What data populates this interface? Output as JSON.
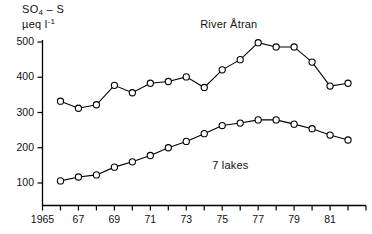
{
  "chart_data": {
    "type": "line",
    "title": "",
    "ylabel": "SO4-S  µeq l-1",
    "ylabel_parts": {
      "line1_pre": "SO",
      "line1_sub": "4",
      "line1_post": " – S",
      "line2_pre": "µeq l",
      "line2_sup": "-1"
    },
    "xlabel": "",
    "xlim": [
      1965,
      1983
    ],
    "ylim": [
      0,
      520
    ],
    "yticks": [
      100,
      200,
      300,
      400,
      500
    ],
    "ytick_labels": [
      "100",
      "200",
      "300",
      "400",
      "500"
    ],
    "xticks": [
      1965,
      1966,
      1967,
      1968,
      1969,
      1970,
      1971,
      1972,
      1973,
      1974,
      1975,
      1976,
      1977,
      1978,
      1979,
      1980,
      1981,
      1982,
      1983
    ],
    "xtick_labels_shown": [
      {
        "x": 1965,
        "label": "1965"
      },
      {
        "x": 1967,
        "label": "67"
      },
      {
        "x": 1969,
        "label": "69"
      },
      {
        "x": 1971,
        "label": "71"
      },
      {
        "x": 1973,
        "label": "73"
      },
      {
        "x": 1975,
        "label": "75"
      },
      {
        "x": 1977,
        "label": "77"
      },
      {
        "x": 1979,
        "label": "79"
      },
      {
        "x": 1981,
        "label": "81"
      }
    ],
    "grid": false,
    "legend_position": "inline-annotation",
    "marker": "open-circle",
    "series": [
      {
        "name": "River Åtran",
        "annotation": "River Åtran",
        "x": [
          1966,
          1967,
          1968,
          1969,
          1970,
          1971,
          1972,
          1973,
          1974,
          1975,
          1976,
          1977,
          1978,
          1979,
          1980,
          1981,
          1982
        ],
        "values": [
          332,
          312,
          322,
          377,
          356,
          383,
          388,
          401,
          371,
          421,
          450,
          498,
          486,
          486,
          443,
          375,
          383
        ]
      },
      {
        "name": "7 lakes",
        "annotation": "7 lakes",
        "x": [
          1966,
          1967,
          1968,
          1969,
          1970,
          1971,
          1972,
          1973,
          1974,
          1975,
          1976,
          1977,
          1978,
          1979,
          1980,
          1981,
          1982
        ],
        "values": [
          106,
          117,
          123,
          145,
          160,
          178,
          200,
          218,
          240,
          263,
          270,
          279,
          279,
          267,
          254,
          236,
          222
        ]
      }
    ],
    "annotations": [
      {
        "text": "River Åtran",
        "x": 1976,
        "y": 520
      },
      {
        "text": "7 lakes",
        "x": 1976,
        "y": 150
      }
    ],
    "colors": {
      "line": "#000000",
      "marker_fill": "#ffffff",
      "axis": "#000000",
      "background": "#ffffff"
    }
  }
}
